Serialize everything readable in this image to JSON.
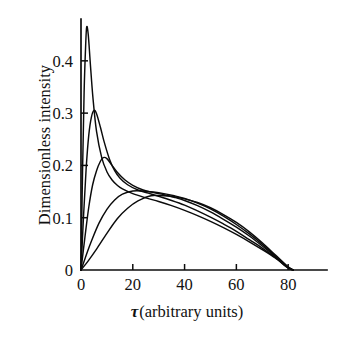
{
  "chart_data": {
    "type": "line",
    "title": "",
    "xlabel": "τ (arbitrary units)",
    "xlabel_symbol": "τ",
    "xlabel_rest": "(arbitrary units)",
    "ylabel": "Dimensionless intensity",
    "xlim": [
      0,
      95
    ],
    "ylim": [
      0,
      0.48
    ],
    "xticks": [
      0,
      20,
      40,
      60,
      80
    ],
    "xtick_labels": [
      "0",
      "20",
      "40",
      "60",
      "80"
    ],
    "yticks": [
      0,
      0.1,
      0.2,
      0.3,
      0.4
    ],
    "ytick_labels": [
      "0",
      "0.1",
      "0.2",
      "0.3",
      "0.4"
    ],
    "grid": false,
    "legend": "none",
    "series_color": "#0b0b0b",
    "series": [
      {
        "name": "curve-1",
        "peak_x": 2.2,
        "peak_y": 0.465,
        "x": [
          0,
          0.6,
          1.2,
          1.8,
          2.2,
          2.8,
          3.6,
          4.6,
          6,
          8,
          10,
          12,
          14,
          16,
          20,
          25,
          30,
          35,
          40,
          45,
          50,
          55,
          60,
          65,
          70,
          75,
          80,
          82
        ],
        "y": [
          0,
          0.19,
          0.34,
          0.43,
          0.465,
          0.45,
          0.395,
          0.33,
          0.265,
          0.215,
          0.188,
          0.172,
          0.162,
          0.155,
          0.146,
          0.138,
          0.131,
          0.123,
          0.114,
          0.104,
          0.093,
          0.081,
          0.068,
          0.054,
          0.039,
          0.023,
          0.004,
          0
        ]
      },
      {
        "name": "curve-2",
        "peak_x": 5.0,
        "peak_y": 0.305,
        "x": [
          0,
          1,
          2,
          3,
          4,
          5,
          6,
          7.5,
          9,
          11,
          13,
          15,
          18,
          22,
          26,
          30,
          35,
          40,
          45,
          50,
          55,
          60,
          65,
          70,
          75,
          80,
          82
        ],
        "y": [
          0,
          0.105,
          0.195,
          0.258,
          0.292,
          0.305,
          0.299,
          0.273,
          0.244,
          0.212,
          0.19,
          0.176,
          0.163,
          0.153,
          0.147,
          0.141,
          0.133,
          0.124,
          0.113,
          0.101,
          0.088,
          0.074,
          0.058,
          0.042,
          0.024,
          0.004,
          0
        ]
      },
      {
        "name": "curve-3",
        "peak_x": 8.6,
        "peak_y": 0.215,
        "x": [
          0,
          1.5,
          3,
          4.5,
          6,
          7.5,
          8.6,
          10,
          12,
          14,
          17,
          20,
          24,
          28,
          32,
          36,
          40,
          45,
          50,
          55,
          60,
          65,
          70,
          75,
          80,
          82
        ],
        "y": [
          0,
          0.062,
          0.12,
          0.163,
          0.19,
          0.208,
          0.215,
          0.213,
          0.2,
          0.187,
          0.172,
          0.162,
          0.153,
          0.148,
          0.144,
          0.139,
          0.133,
          0.123,
          0.111,
          0.097,
          0.082,
          0.065,
          0.046,
          0.026,
          0.005,
          0
        ]
      },
      {
        "name": "curve-4",
        "peak_x": 20.0,
        "peak_y": 0.151,
        "x": [
          0,
          2,
          4,
          7,
          10,
          13,
          16,
          20,
          24,
          28,
          32,
          36,
          40,
          45,
          50,
          55,
          60,
          65,
          70,
          75,
          80,
          82
        ],
        "y": [
          0,
          0.028,
          0.055,
          0.09,
          0.116,
          0.134,
          0.145,
          0.151,
          0.151,
          0.149,
          0.146,
          0.142,
          0.137,
          0.128,
          0.117,
          0.103,
          0.087,
          0.069,
          0.049,
          0.027,
          0.005,
          0
        ]
      },
      {
        "name": "curve-5",
        "peak_x": 27.0,
        "peak_y": 0.142,
        "x": [
          0,
          3,
          6,
          10,
          14,
          18,
          22,
          27,
          32,
          36,
          40,
          45,
          50,
          55,
          60,
          65,
          70,
          75,
          80,
          82
        ],
        "y": [
          0,
          0.019,
          0.04,
          0.07,
          0.098,
          0.118,
          0.132,
          0.142,
          0.142,
          0.14,
          0.136,
          0.129,
          0.119,
          0.106,
          0.091,
          0.073,
          0.052,
          0.029,
          0.006,
          0
        ]
      }
    ]
  }
}
